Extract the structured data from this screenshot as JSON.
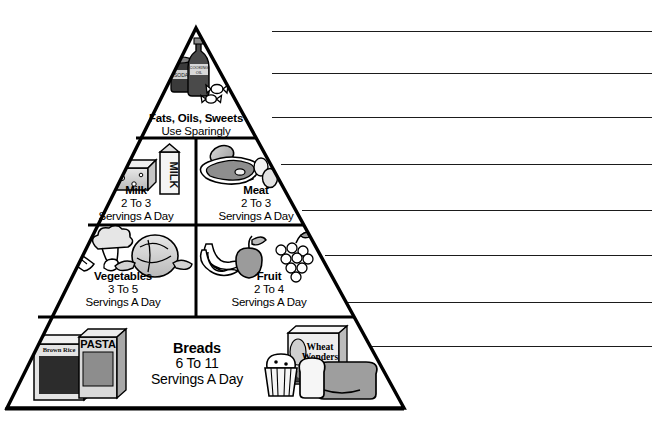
{
  "page": {
    "background_color": "#ffffff",
    "ink_color": "#000000",
    "width": 661,
    "height": 423
  },
  "pyramid": {
    "name": "food-guide-pyramid",
    "apex": {
      "x": 196,
      "y": 28
    },
    "base_left": {
      "x": 7,
      "y": 408
    },
    "base_right": {
      "x": 404,
      "y": 408
    },
    "divider_y": [
      138,
      225,
      317
    ],
    "vertical_divider_x": 196,
    "levels": [
      {
        "id": "fats-oils-sweets",
        "group": "Fats, Oils, Sweets",
        "servings": "Use Sparingly",
        "servings_line2": "",
        "icons": [
          "soda-can-icon",
          "cooking-oil-bottle-icon",
          "candy-icon"
        ]
      },
      {
        "id": "milk",
        "group": "Milk",
        "servings": "2 To 3",
        "servings_line2": "Servings A Day",
        "icons": [
          "milk-carton-icon",
          "cheese-icon"
        ]
      },
      {
        "id": "meat",
        "group": "Meat",
        "servings": "2 To 3",
        "servings_line2": "Servings A Day",
        "icons": [
          "drumstick-icon",
          "steak-icon",
          "eggs-icon"
        ]
      },
      {
        "id": "vegetables",
        "group": "Vegetables",
        "servings": "3 To 5",
        "servings_line2": "Servings A Day",
        "icons": [
          "carrot-icon",
          "broccoli-icon",
          "cabbage-icon"
        ]
      },
      {
        "id": "fruit",
        "group": "Fruit",
        "servings": "2 To 4",
        "servings_line2": "Servings A Day",
        "icons": [
          "banana-icon",
          "apple-icon",
          "grapes-icon"
        ]
      },
      {
        "id": "breads",
        "group": "Breads",
        "servings": "6 To 11",
        "servings_line2": "Servings A Day",
        "icons": [
          "brown-rice-box-icon",
          "pasta-box-icon",
          "wheat-wonders-cereal-box-icon",
          "muffin-icon",
          "bread-loaf-icon"
        ]
      }
    ],
    "product_labels": {
      "milk_carton": "MILK",
      "soda_can": "SODA",
      "oil_bottle": "COOKING OIL",
      "rice_box": "Brown Rice",
      "pasta_box": "PASTA",
      "cereal_box_line1": "Wheat",
      "cereal_box_line2": "Wonders"
    }
  },
  "answer_lines": {
    "count": 8,
    "right_edge_x": 652,
    "lines": [
      {
        "index": 1,
        "x": 272,
        "y": 31,
        "width": 380
      },
      {
        "index": 2,
        "x": 272,
        "y": 73,
        "width": 380
      },
      {
        "index": 3,
        "x": 272,
        "y": 117,
        "width": 380
      },
      {
        "index": 4,
        "x": 281,
        "y": 164,
        "width": 371
      },
      {
        "index": 5,
        "x": 302,
        "y": 210,
        "width": 350
      },
      {
        "index": 6,
        "x": 325,
        "y": 255,
        "width": 327
      },
      {
        "index": 7,
        "x": 348,
        "y": 302,
        "width": 304
      },
      {
        "index": 8,
        "x": 372,
        "y": 346,
        "width": 280
      }
    ]
  }
}
